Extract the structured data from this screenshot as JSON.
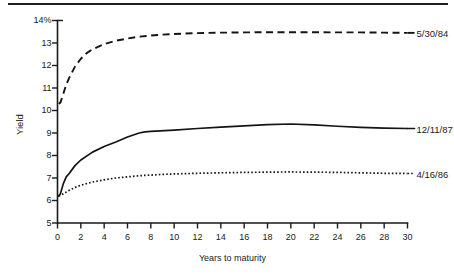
{
  "chart_data": {
    "type": "line",
    "title": "",
    "xlabel": "Years to maturity",
    "ylabel": "Yield",
    "xlim": [
      0,
      30
    ],
    "ylim": [
      5,
      14
    ],
    "grid": false,
    "legend_position": "right-inline-labels",
    "x_ticks": [
      "0",
      "2",
      "4",
      "6",
      "8",
      "10",
      "12",
      "14",
      "16",
      "18",
      "20",
      "22",
      "24",
      "26",
      "28",
      "30"
    ],
    "x_tick_values": [
      0,
      2,
      4,
      6,
      8,
      10,
      12,
      14,
      16,
      18,
      20,
      22,
      24,
      26,
      28,
      30
    ],
    "y_ticks": [
      "5",
      "6",
      "7",
      "8",
      "9",
      "10",
      "11",
      "12",
      "13",
      "14%"
    ],
    "y_tick_values": [
      5,
      6,
      7,
      8,
      9,
      10,
      11,
      12,
      13,
      14
    ],
    "series": [
      {
        "name": "5/30/84",
        "style": "dashed",
        "label_x": 30,
        "label_y": 13.45,
        "x": [
          0.1,
          0.25,
          0.5,
          0.75,
          1,
          1.5,
          2,
          2.5,
          3,
          4,
          5,
          6,
          7,
          8,
          9,
          10,
          12,
          14,
          16,
          18,
          20,
          22,
          24,
          26,
          28,
          30
        ],
        "values": [
          10.3,
          10.35,
          10.75,
          11.15,
          11.45,
          11.95,
          12.3,
          12.55,
          12.72,
          12.95,
          13.1,
          13.2,
          13.28,
          13.33,
          13.37,
          13.4,
          13.44,
          13.46,
          13.47,
          13.48,
          13.48,
          13.48,
          13.47,
          13.47,
          13.46,
          13.45
        ]
      },
      {
        "name": "12/11/87",
        "style": "solid",
        "label_x": 30,
        "label_y": 9.2,
        "x": [
          0.1,
          0.25,
          0.5,
          0.75,
          1,
          1.5,
          2,
          3,
          4,
          5,
          6,
          7,
          7.5,
          8,
          10,
          12,
          14,
          16,
          18,
          20,
          22,
          24,
          26,
          28,
          30
        ],
        "values": [
          6.2,
          6.3,
          6.75,
          7.05,
          7.2,
          7.55,
          7.8,
          8.15,
          8.4,
          8.6,
          8.82,
          9.0,
          9.05,
          9.07,
          9.13,
          9.2,
          9.26,
          9.32,
          9.37,
          9.4,
          9.36,
          9.3,
          9.25,
          9.22,
          9.2
        ]
      },
      {
        "name": "4/16/86",
        "style": "dotted",
        "label_x": 30,
        "label_y": 7.2,
        "x": [
          0.1,
          0.25,
          0.5,
          1,
          1.5,
          2,
          3,
          4,
          5,
          6,
          7,
          8,
          9,
          10,
          12,
          14,
          16,
          18,
          20,
          22,
          24,
          26,
          28,
          30
        ],
        "values": [
          6.2,
          6.22,
          6.3,
          6.45,
          6.58,
          6.68,
          6.82,
          6.92,
          7.0,
          7.05,
          7.1,
          7.13,
          7.16,
          7.18,
          7.21,
          7.23,
          7.25,
          7.26,
          7.27,
          7.26,
          7.25,
          7.23,
          7.21,
          7.2
        ]
      }
    ]
  },
  "colors": {
    "ink": "#141414",
    "background": "#ffffff"
  }
}
